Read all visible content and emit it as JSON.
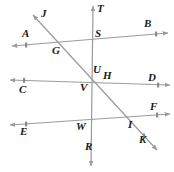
{
  "figure": {
    "canvas": {
      "width": 174,
      "height": 172
    },
    "colors": {
      "line": "#9a9a9a",
      "label": "#1a1a1a",
      "background": "#ffffff",
      "tick": "#8a8a8a"
    },
    "lines": [
      {
        "name": "line-ab",
        "endpoints_label": [
          "A",
          "B"
        ],
        "x1": 12,
        "y1": 46,
        "x2": 168,
        "y2": 33,
        "double_arrow": true
      },
      {
        "name": "line-cd",
        "endpoints_label": [
          "C",
          "D"
        ],
        "x1": 10,
        "y1": 80,
        "x2": 170,
        "y2": 85,
        "double_arrow": true
      },
      {
        "name": "line-ef",
        "endpoints_label": [
          "E",
          "F"
        ],
        "x1": 10,
        "y1": 125,
        "x2": 170,
        "y2": 114,
        "double_arrow": true
      },
      {
        "name": "line-tr",
        "endpoints_label": [
          "T",
          "R"
        ],
        "x1": 93,
        "y1": 6,
        "x2": 91,
        "y2": 166,
        "double_arrow": true
      },
      {
        "name": "line-jk",
        "endpoints_label": [
          "J",
          "K"
        ],
        "x1": 33,
        "y1": 15,
        "x2": 157,
        "y2": 150,
        "double_arrow": true
      }
    ],
    "points": [
      {
        "name": "point-j",
        "label": "J",
        "x": 41,
        "y": 8
      },
      {
        "name": "point-t",
        "label": "T",
        "x": 97,
        "y": 3
      },
      {
        "name": "point-b",
        "label": "B",
        "x": 144,
        "y": 18
      },
      {
        "name": "point-a",
        "label": "A",
        "x": 22,
        "y": 28
      },
      {
        "name": "point-s",
        "label": "S",
        "x": 95,
        "y": 28
      },
      {
        "name": "point-g",
        "label": "G",
        "x": 52,
        "y": 45
      },
      {
        "name": "point-u",
        "label": "U",
        "x": 93,
        "y": 64
      },
      {
        "name": "point-h",
        "label": "H",
        "x": 103,
        "y": 70
      },
      {
        "name": "point-d",
        "label": "D",
        "x": 148,
        "y": 72
      },
      {
        "name": "point-c",
        "label": "C",
        "x": 19,
        "y": 84
      },
      {
        "name": "point-v",
        "label": "V",
        "x": 80,
        "y": 82
      },
      {
        "name": "point-f",
        "label": "F",
        "x": 150,
        "y": 101
      },
      {
        "name": "point-e",
        "label": "E",
        "x": 20,
        "y": 126
      },
      {
        "name": "point-w",
        "label": "W",
        "x": 76,
        "y": 121
      },
      {
        "name": "point-i",
        "label": "I",
        "x": 128,
        "y": 119
      },
      {
        "name": "point-k",
        "label": "K",
        "x": 139,
        "y": 134
      },
      {
        "name": "point-r",
        "label": "R",
        "x": 85,
        "y": 141
      }
    ],
    "tick_marks": [
      {
        "name": "tick-a",
        "x": 26,
        "y": 45
      },
      {
        "name": "tick-b",
        "x": 156,
        "y": 34
      },
      {
        "name": "tick-c",
        "x": 24,
        "y": 80
      },
      {
        "name": "tick-d",
        "x": 158,
        "y": 85
      },
      {
        "name": "tick-e",
        "x": 26,
        "y": 124
      },
      {
        "name": "tick-f",
        "x": 157,
        "y": 115
      },
      {
        "name": "tick-k",
        "x": 144,
        "y": 136
      }
    ]
  }
}
